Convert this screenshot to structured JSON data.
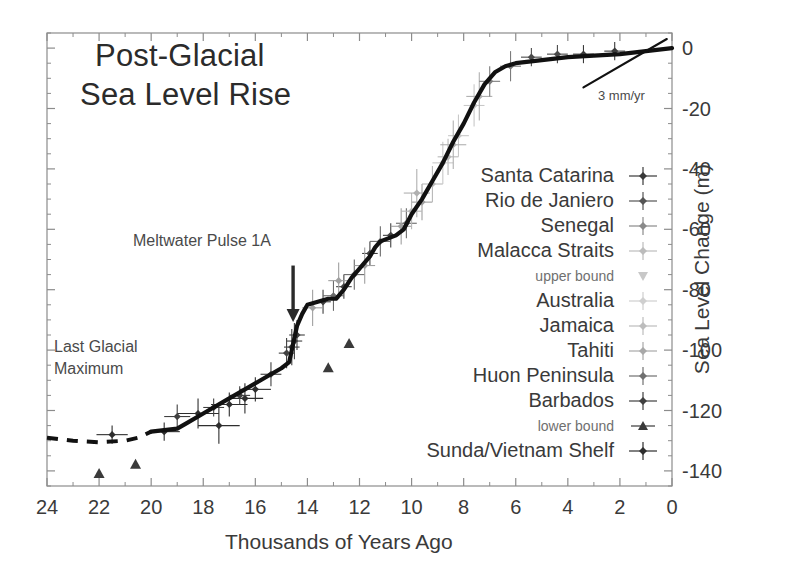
{
  "chart_data": {
    "type": "scatter",
    "title": "Post-Glacial Sea Level Rise",
    "title_line1": "Post-Glacial",
    "title_line2": "Sea Level Rise",
    "xlabel": "Thousands of Years Ago",
    "ylabel": "Sea Level Change (m)",
    "xlim": [
      24,
      0
    ],
    "ylim": [
      -145,
      5
    ],
    "x_ticks": [
      24,
      22,
      20,
      18,
      16,
      14,
      12,
      10,
      8,
      6,
      4,
      2,
      0
    ],
    "y_ticks": [
      0,
      -20,
      -40,
      -60,
      -80,
      -100,
      -120,
      -140
    ],
    "x_minor_interval": 1,
    "y_minor_interval": 5,
    "grid": false,
    "x_inverted": true,
    "legend_position": "center-right",
    "annotations": [
      {
        "name": "meltwater-pulse-1a",
        "text": "Meltwater Pulse 1A",
        "x": 15.6,
        "y": -68,
        "arrow_to_x": 14.6,
        "arrow_to_y": -88
      },
      {
        "name": "last-glacial-maximum-line1",
        "text": "Last Glacial",
        "x": 23.0,
        "y": -103
      },
      {
        "name": "last-glacial-maximum-line2",
        "text": "Maximum",
        "x": 23.0,
        "y": -110
      },
      {
        "name": "modern-rate",
        "text": "3 mm/yr",
        "x": 2.6,
        "y": -12
      }
    ],
    "series": [
      {
        "name": "Santa Catarina",
        "marker": "diamond-errorbar",
        "color": "#3a3a3a"
      },
      {
        "name": "Rio de Janiero",
        "marker": "diamond-errorbar",
        "color": "#4a4a4a"
      },
      {
        "name": "Senegal",
        "marker": "diamond-errorbar",
        "color": "#7c7c7c"
      },
      {
        "name": "Malacca Straits",
        "marker": "diamond-errorbar",
        "color": "#b0b0b0"
      },
      {
        "name": "upper bound",
        "marker": "triangle-down",
        "color": "#c0c0c0"
      },
      {
        "name": "Australia",
        "marker": "diamond-errorbar",
        "color": "#c8c8c8"
      },
      {
        "name": "Jamaica",
        "marker": "diamond-errorbar",
        "color": "#b8b8b8"
      },
      {
        "name": "Tahiti",
        "marker": "diamond-errorbar",
        "color": "#a0a0a0"
      },
      {
        "name": "Huon Peninsula",
        "marker": "diamond-errorbar",
        "color": "#6a6a6a"
      },
      {
        "name": "Barbados",
        "marker": "diamond-errorbar",
        "color": "#404040"
      },
      {
        "name": "lower bound",
        "marker": "triangle-up",
        "color": "#3a3a3a"
      },
      {
        "name": "Sunda/Vietnam Shelf",
        "marker": "diamond-errorbar",
        "color": "#2e2e2e"
      }
    ],
    "fit_curve": {
      "name": "sea-level-fit-curve",
      "style": "solid-thick-black",
      "points": [
        [
          20.0,
          -127
        ],
        [
          19.0,
          -126
        ],
        [
          18.6,
          -124
        ],
        [
          18.0,
          -121
        ],
        [
          17.2,
          -117
        ],
        [
          16.4,
          -113
        ],
        [
          15.6,
          -109
        ],
        [
          15.0,
          -106
        ],
        [
          14.7,
          -104
        ],
        [
          14.6,
          -100
        ],
        [
          14.5,
          -96
        ],
        [
          14.4,
          -92
        ],
        [
          14.2,
          -88
        ],
        [
          14.0,
          -85
        ],
        [
          13.6,
          -84
        ],
        [
          13.2,
          -83
        ],
        [
          12.9,
          -83
        ],
        [
          12.6,
          -80
        ],
        [
          12.3,
          -76
        ],
        [
          12.0,
          -73
        ],
        [
          11.6,
          -69
        ],
        [
          11.4,
          -66
        ],
        [
          11.2,
          -64
        ],
        [
          10.9,
          -63
        ],
        [
          10.6,
          -62
        ],
        [
          10.3,
          -60
        ],
        [
          10.0,
          -55
        ],
        [
          9.6,
          -50
        ],
        [
          9.2,
          -44
        ],
        [
          8.8,
          -38
        ],
        [
          8.4,
          -31
        ],
        [
          8.0,
          -25
        ],
        [
          7.6,
          -18
        ],
        [
          7.2,
          -12
        ],
        [
          6.8,
          -8
        ],
        [
          6.4,
          -6
        ],
        [
          6.0,
          -5
        ],
        [
          5.0,
          -4
        ],
        [
          4.0,
          -3
        ],
        [
          3.0,
          -2.5
        ],
        [
          2.0,
          -2
        ],
        [
          1.0,
          -1
        ],
        [
          0.0,
          0
        ]
      ]
    },
    "dashed_extension": {
      "name": "lgm-dashed-segment",
      "style": "dashed-black",
      "points": [
        [
          24.0,
          -129
        ],
        [
          23.0,
          -130
        ],
        [
          22.0,
          -130.5
        ],
        [
          21.0,
          -130
        ],
        [
          20.5,
          -129
        ],
        [
          20.0,
          -127
        ]
      ]
    },
    "tangent_line": {
      "name": "modern-rate-tangent",
      "points": [
        [
          3.4,
          -13
        ],
        [
          0.2,
          3
        ]
      ]
    },
    "data_points": [
      {
        "series": "Sunda/Vietnam Shelf",
        "x": 21.5,
        "y": -128,
        "xerr": 0.6,
        "yerr": 3
      },
      {
        "series": "Sunda/Vietnam Shelf",
        "x": 19.5,
        "y": -127,
        "xerr": 0.6,
        "yerr": 3
      },
      {
        "series": "Sunda/Vietnam Shelf",
        "x": 18.2,
        "y": -121,
        "xerr": 0.8,
        "yerr": 5
      },
      {
        "series": "Sunda/Vietnam Shelf",
        "x": 17.4,
        "y": -125,
        "xerr": 0.8,
        "yerr": 6
      },
      {
        "series": "Sunda/Vietnam Shelf",
        "x": 17.0,
        "y": -118,
        "xerr": 0.7,
        "yerr": 4
      },
      {
        "series": "Sunda/Vietnam Shelf",
        "x": 16.4,
        "y": -116,
        "xerr": 0.7,
        "yerr": 5
      },
      {
        "series": "Sunda/Vietnam Shelf",
        "x": 16.0,
        "y": -113,
        "xerr": 0.6,
        "yerr": 4
      },
      {
        "series": "Barbados",
        "x": 19.0,
        "y": -122,
        "xerr": 0.5,
        "yerr": 4
      },
      {
        "series": "Barbados",
        "x": 17.6,
        "y": -119,
        "xerr": 0.4,
        "yerr": 3
      },
      {
        "series": "Barbados",
        "x": 16.6,
        "y": -115,
        "xerr": 0.4,
        "yerr": 3
      },
      {
        "series": "Barbados",
        "x": 15.4,
        "y": -108,
        "xerr": 0.4,
        "yerr": 4
      },
      {
        "series": "Barbados",
        "x": 14.8,
        "y": -101,
        "xerr": 0.3,
        "yerr": 5
      },
      {
        "series": "Barbados",
        "x": 14.6,
        "y": -99,
        "xerr": 0.3,
        "yerr": 6
      },
      {
        "series": "Barbados",
        "x": 14.5,
        "y": -97,
        "xerr": 0.3,
        "yerr": 6
      },
      {
        "series": "Barbados",
        "x": 14.4,
        "y": -95,
        "xerr": 0.3,
        "yerr": 5
      },
      {
        "series": "Barbados",
        "x": 13.4,
        "y": -84,
        "xerr": 0.3,
        "yerr": 4
      },
      {
        "series": "Barbados",
        "x": 12.6,
        "y": -79,
        "xerr": 0.3,
        "yerr": 4
      },
      {
        "series": "Barbados",
        "x": 11.6,
        "y": -68,
        "xerr": 0.3,
        "yerr": 4
      },
      {
        "series": "Barbados",
        "x": 10.8,
        "y": -62,
        "xerr": 0.3,
        "yerr": 4
      },
      {
        "series": "Huon Peninsula",
        "x": 13.0,
        "y": -82,
        "xerr": 0.4,
        "yerr": 5
      },
      {
        "series": "Huon Peninsula",
        "x": 12.2,
        "y": -75,
        "xerr": 0.4,
        "yerr": 5
      },
      {
        "series": "Huon Peninsula",
        "x": 11.2,
        "y": -64,
        "xerr": 0.4,
        "yerr": 5
      },
      {
        "series": "Huon Peninsula",
        "x": 10.2,
        "y": -58,
        "xerr": 0.4,
        "yerr": 5
      },
      {
        "series": "Tahiti",
        "x": 13.8,
        "y": -86,
        "xerr": 0.4,
        "yerr": 6
      },
      {
        "series": "Tahiti",
        "x": 12.8,
        "y": -77,
        "xerr": 0.4,
        "yerr": 6
      },
      {
        "series": "Tahiti",
        "x": 11.8,
        "y": -72,
        "xerr": 0.4,
        "yerr": 6
      },
      {
        "series": "Tahiti",
        "x": 10.4,
        "y": -59,
        "xerr": 0.4,
        "yerr": 6
      },
      {
        "series": "Tahiti",
        "x": 9.6,
        "y": -51,
        "xerr": 0.4,
        "yerr": 6
      },
      {
        "series": "Jamaica",
        "x": 10.0,
        "y": -54,
        "xerr": 0.4,
        "yerr": 6
      },
      {
        "series": "Jamaica",
        "x": 9.2,
        "y": -45,
        "xerr": 0.4,
        "yerr": 6
      },
      {
        "series": "Jamaica",
        "x": 8.6,
        "y": -36,
        "xerr": 0.4,
        "yerr": 6
      },
      {
        "series": "Australia",
        "x": 8.8,
        "y": -38,
        "xerr": 0.4,
        "yerr": 7
      },
      {
        "series": "Australia",
        "x": 8.2,
        "y": -29,
        "xerr": 0.4,
        "yerr": 7
      },
      {
        "series": "Australia",
        "x": 7.6,
        "y": -19,
        "xerr": 0.4,
        "yerr": 7
      },
      {
        "series": "Malacca Straits",
        "x": 9.8,
        "y": -48,
        "xerr": 0.5,
        "yerr": 8
      },
      {
        "series": "Malacca Straits",
        "x": 8.4,
        "y": -32,
        "xerr": 0.5,
        "yerr": 8
      },
      {
        "series": "Malacca Straits",
        "x": 7.4,
        "y": -16,
        "xerr": 0.5,
        "yerr": 8
      },
      {
        "series": "Senegal",
        "x": 7.0,
        "y": -11,
        "xerr": 0.4,
        "yerr": 5
      },
      {
        "series": "Senegal",
        "x": 6.2,
        "y": -6,
        "xerr": 0.4,
        "yerr": 5
      },
      {
        "series": "Rio de Janiero",
        "x": 5.4,
        "y": -3,
        "xerr": 0.4,
        "yerr": 3
      },
      {
        "series": "Rio de Janiero",
        "x": 4.4,
        "y": -2,
        "xerr": 0.4,
        "yerr": 3
      },
      {
        "series": "Santa Catarina",
        "x": 3.4,
        "y": -2,
        "xerr": 0.4,
        "yerr": 3
      },
      {
        "series": "Santa Catarina",
        "x": 2.2,
        "y": -1,
        "xerr": 0.4,
        "yerr": 3
      },
      {
        "series": "lower bound",
        "x": 22.0,
        "y": -141,
        "xerr": 0,
        "yerr": 0
      },
      {
        "series": "lower bound",
        "x": 20.6,
        "y": -138,
        "xerr": 0,
        "yerr": 0
      },
      {
        "series": "lower bound",
        "x": 13.2,
        "y": -106,
        "xerr": 0,
        "yerr": 0
      },
      {
        "series": "lower bound",
        "x": 12.4,
        "y": -98,
        "xerr": 0,
        "yerr": 0
      }
    ]
  },
  "legend": {
    "entries": [
      {
        "label": "Santa Catarina",
        "marker": "diamond-errorbar",
        "color": "#3a3a3a",
        "size": "normal"
      },
      {
        "label": "Rio de Janiero",
        "marker": "diamond-errorbar",
        "color": "#555555",
        "size": "normal"
      },
      {
        "label": "Senegal",
        "marker": "diamond-errorbar",
        "color": "#8a8a8a",
        "size": "normal"
      },
      {
        "label": "Malacca Straits",
        "marker": "diamond-errorbar",
        "color": "#bcbcbc",
        "size": "normal"
      },
      {
        "label": "upper bound",
        "marker": "triangle-down",
        "color": "#c8c8c8",
        "size": "small"
      },
      {
        "label": "Australia",
        "marker": "diamond-errorbar",
        "color": "#cfcfcf",
        "size": "normal"
      },
      {
        "label": "Jamaica",
        "marker": "diamond-errorbar",
        "color": "#bdbdbd",
        "size": "normal"
      },
      {
        "label": "Tahiti",
        "marker": "diamond-errorbar",
        "color": "#a8a8a8",
        "size": "normal"
      },
      {
        "label": "Huon Peninsula",
        "marker": "diamond-errorbar",
        "color": "#707070",
        "size": "normal"
      },
      {
        "label": "Barbados",
        "marker": "diamond-errorbar",
        "color": "#404040",
        "size": "normal"
      },
      {
        "label": "lower bound",
        "marker": "triangle-up",
        "color": "#3a3a3a",
        "size": "small"
      },
      {
        "label": "Sunda/Vietnam Shelf",
        "marker": "diamond-errorbar",
        "color": "#2e2e2e",
        "size": "normal"
      }
    ]
  },
  "axes": {
    "x_tick_labels": [
      "24",
      "22",
      "20",
      "18",
      "16",
      "14",
      "12",
      "10",
      "8",
      "6",
      "4",
      "2",
      "0"
    ],
    "y_tick_labels": [
      "0",
      "-20",
      "-40",
      "-60",
      "-80",
      "-100",
      "-120",
      "-140"
    ],
    "x_title": "Thousands of Years Ago",
    "y_title": "Sea Level Change (m)"
  },
  "annotations": {
    "meltwater_pulse": "Meltwater Pulse 1A",
    "lgm_line1": "Last Glacial",
    "lgm_line2": "Maximum",
    "rate": "3 mm/yr"
  },
  "colors": {
    "axis": "#8c8c8c",
    "text": "#3a3a3a",
    "curve": "#111111",
    "background": "#ffffff"
  }
}
